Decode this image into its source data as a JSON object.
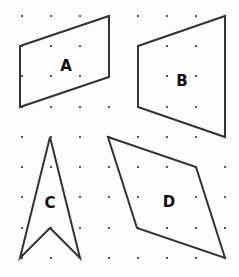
{
  "grid": {
    "columns_x": [
      22,
      51,
      80,
      109,
      138,
      167,
      196,
      225
    ],
    "rows_y": [
      16,
      46,
      76,
      107,
      137,
      167,
      197,
      228,
      258
    ],
    "dot_color": "#222222"
  },
  "shapes": [
    {
      "label": "A",
      "points": "20,46 109,16 109,77 20,107",
      "label_pos": [
        66,
        66
      ]
    },
    {
      "label": "B",
      "points": "138,46 225,16 225,137 138,107",
      "label_pos": [
        182,
        81
      ]
    },
    {
      "label": "C",
      "points": "50,137 80,258 50,228 20,258",
      "label_pos": [
        50,
        203
      ]
    },
    {
      "label": "D",
      "points": "108,137 196,167 225,258 137,228",
      "label_pos": [
        169,
        202
      ]
    }
  ],
  "stroke_color": "#333333"
}
